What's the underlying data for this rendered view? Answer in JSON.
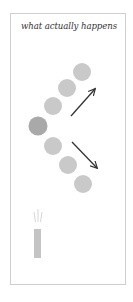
{
  "figure": {
    "title": "what actually happens",
    "colors": {
      "border": "#cfcfcf",
      "circle_light": "#c9c9c9",
      "circle_dark": "#a9a9a9",
      "arrow": "#333333",
      "bar": "#c4c4c4",
      "spark": "#d6d6d6"
    },
    "circles": [
      {
        "id": "upper-3",
        "cx": 82,
        "cy": 72,
        "r": 9,
        "shade": "light"
      },
      {
        "id": "upper-2",
        "cx": 67,
        "cy": 88,
        "r": 9,
        "shade": "light"
      },
      {
        "id": "upper-1",
        "cx": 53,
        "cy": 106,
        "r": 9,
        "shade": "light"
      },
      {
        "id": "origin",
        "cx": 38,
        "cy": 126,
        "r": 9.5,
        "shade": "dark"
      },
      {
        "id": "lower-1",
        "cx": 53,
        "cy": 146,
        "r": 9,
        "shade": "light"
      },
      {
        "id": "lower-2",
        "cx": 68,
        "cy": 165,
        "r": 9,
        "shade": "light"
      },
      {
        "id": "lower-3",
        "cx": 83,
        "cy": 184,
        "r": 9,
        "shade": "light"
      }
    ],
    "arrows": [
      {
        "id": "arrow-up-right",
        "x1": 71,
        "y1": 116,
        "x2": 95,
        "y2": 89
      },
      {
        "id": "arrow-down-right",
        "x1": 72,
        "y1": 142,
        "x2": 97,
        "y2": 168
      }
    ],
    "bar": {
      "x": 34,
      "y": 229,
      "width": 7,
      "height": 29
    },
    "spark_lines": [
      {
        "x1": 34,
        "y1": 212,
        "x2": 35.5,
        "y2": 222
      },
      {
        "x1": 38,
        "y1": 209,
        "x2": 38,
        "y2": 222
      },
      {
        "x1": 42,
        "y1": 212,
        "x2": 40.5,
        "y2": 222
      }
    ]
  }
}
